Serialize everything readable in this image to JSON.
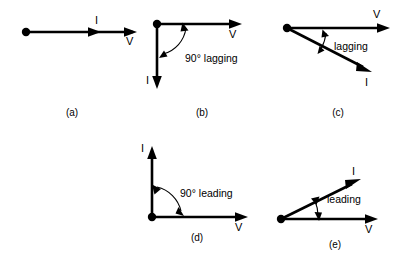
{
  "figure": {
    "background_color": "#ffffff",
    "stroke_color": "#000000"
  },
  "panels": [
    {
      "id": "a",
      "caption": "(a)",
      "description": "In phase: current and voltage collinear",
      "vectors": [
        {
          "name": "I",
          "label": "I",
          "angle_deg": 0,
          "label_position": "above-mid"
        },
        {
          "name": "V",
          "label": "V",
          "angle_deg": 0,
          "label_position": "below-end"
        }
      ],
      "annotation": null
    },
    {
      "id": "b",
      "caption": "(b)",
      "description": "Current lagging voltage by ninety degrees",
      "vectors": [
        {
          "name": "V",
          "label": "V",
          "angle_deg": 0,
          "label_position": "below-end"
        },
        {
          "name": "I",
          "label": "I",
          "angle_deg": -90,
          "label_position": "left-end"
        }
      ],
      "annotation": {
        "text": "90° lagging",
        "arc": "double-headed"
      }
    },
    {
      "id": "c",
      "caption": "(c)",
      "description": "Current lagging voltage by an acute angle",
      "vectors": [
        {
          "name": "V",
          "label": "V",
          "angle_deg": 0,
          "label_position": "above-end"
        },
        {
          "name": "I",
          "label": "I",
          "angle_deg": -27,
          "label_position": "below-end"
        }
      ],
      "annotation": {
        "text": "lagging",
        "arc": "double-headed"
      }
    },
    {
      "id": "d",
      "caption": "(d)",
      "description": "Current leading voltage by ninety degrees",
      "vectors": [
        {
          "name": "I",
          "label": "I",
          "angle_deg": 90,
          "label_position": "left-end"
        },
        {
          "name": "V",
          "label": "V",
          "angle_deg": 0,
          "label_position": "below-end"
        }
      ],
      "annotation": {
        "text": "90° leading",
        "arc": "double-headed"
      }
    },
    {
      "id": "e",
      "caption": "(e)",
      "description": "Current leading voltage by an acute angle",
      "vectors": [
        {
          "name": "I",
          "label": "I",
          "angle_deg": 26,
          "label_position": "above-end"
        },
        {
          "name": "V",
          "label": "V",
          "angle_deg": 0,
          "label_position": "below-end"
        }
      ],
      "annotation": {
        "text": "leading",
        "arc": "double-headed"
      }
    }
  ],
  "labels": {
    "v": "V",
    "i": "I",
    "ninety_lagging": "90° lagging",
    "lagging": "lagging",
    "ninety_leading": "90° leading",
    "leading": "leading",
    "cap_a": "(a)",
    "cap_b": "(b)",
    "cap_c": "(c)",
    "cap_d": "(d)",
    "cap_e": "(e)"
  }
}
